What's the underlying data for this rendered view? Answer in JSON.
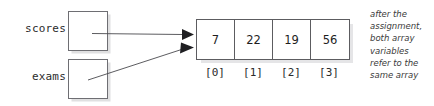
{
  "diagram": {
    "variables": [
      {
        "name": "scores",
        "label": "scores"
      },
      {
        "name": "exams",
        "label": "exams"
      }
    ],
    "array": {
      "values": [
        "7",
        "22",
        "19",
        "56"
      ],
      "indices": [
        "[0]",
        "[1]",
        "[2]",
        "[3]"
      ]
    },
    "annotation": {
      "lines": [
        "after the",
        "assignment,",
        "both array",
        "variables",
        "refer to the",
        "same array"
      ]
    },
    "colors": {
      "background": "#ffffff",
      "box_border": "#6e6e73",
      "array_border": "#5c5c60",
      "text": "#1e1e1e",
      "annotation_text": "#3a3a3a",
      "connector": "#4a4a4e",
      "shadow": "#d9d9dd"
    }
  }
}
